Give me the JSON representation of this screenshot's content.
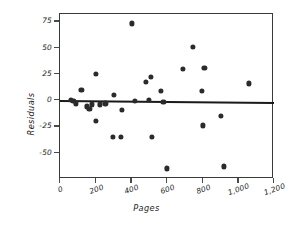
{
  "chart_data": {
    "type": "scatter",
    "title": "",
    "xlabel": "Pages",
    "ylabel": "Residuals",
    "xlim": [
      0,
      1200
    ],
    "ylim": [
      -75,
      82
    ],
    "grid": false,
    "legend": null,
    "xticks": [
      0,
      200,
      400,
      600,
      800,
      1000,
      1200
    ],
    "xticklabels": [
      "0",
      "200",
      "400",
      "600",
      "800",
      "1,000",
      "1,200"
    ],
    "yticks": [
      75,
      50,
      25,
      0,
      -25,
      -50
    ],
    "yticklabels": [
      "75",
      "50",
      "25",
      "0",
      "-25",
      "-50"
    ],
    "marker_color": "#2b2b2b",
    "line_color": "#1a1a1a",
    "points": [
      {
        "x": 60,
        "y": 0
      },
      {
        "x": 75,
        "y": -1
      },
      {
        "x": 90,
        "y": -3
      },
      {
        "x": 120,
        "y": 10
      },
      {
        "x": 150,
        "y": -6
      },
      {
        "x": 165,
        "y": -8
      },
      {
        "x": 180,
        "y": -4
      },
      {
        "x": 200,
        "y": 25
      },
      {
        "x": 200,
        "y": -20
      },
      {
        "x": 225,
        "y": -4
      },
      {
        "x": 255,
        "y": -3
      },
      {
        "x": 295,
        "y": -35
      },
      {
        "x": 300,
        "y": 5
      },
      {
        "x": 340,
        "y": -35
      },
      {
        "x": 345,
        "y": -9
      },
      {
        "x": 405,
        "y": 73
      },
      {
        "x": 420,
        "y": -1
      },
      {
        "x": 480,
        "y": 17
      },
      {
        "x": 500,
        "y": 0
      },
      {
        "x": 510,
        "y": 22
      },
      {
        "x": 515,
        "y": -35
      },
      {
        "x": 565,
        "y": 9
      },
      {
        "x": 580,
        "y": -2
      },
      {
        "x": 600,
        "y": -65
      },
      {
        "x": 690,
        "y": 30
      },
      {
        "x": 745,
        "y": 51
      },
      {
        "x": 795,
        "y": 9
      },
      {
        "x": 800,
        "y": -24
      },
      {
        "x": 810,
        "y": 31
      },
      {
        "x": 900,
        "y": -15
      },
      {
        "x": 920,
        "y": -63
      },
      {
        "x": 1060,
        "y": 16
      }
    ],
    "fit_line": {
      "x_start": 0,
      "x_end": 1200,
      "y_start": 0.5,
      "y_end": -1.5
    }
  }
}
